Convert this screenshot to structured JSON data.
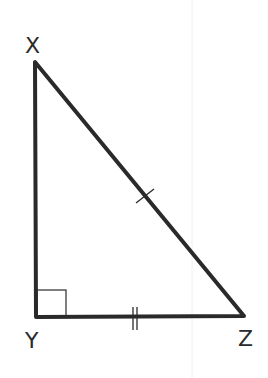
{
  "diagram": {
    "type": "right-triangle",
    "vertices": {
      "X": {
        "label": "X",
        "x": 35,
        "y": 62
      },
      "Y": {
        "label": "Y",
        "x": 36,
        "y": 317
      },
      "Z": {
        "label": "Z",
        "x": 244,
        "y": 316
      }
    },
    "right_angle_at": "Y",
    "marks": {
      "XZ": "single-tick",
      "YZ": "double-tick"
    },
    "colors": {
      "stroke": "#2a2a2a",
      "background": "#ffffff"
    }
  }
}
